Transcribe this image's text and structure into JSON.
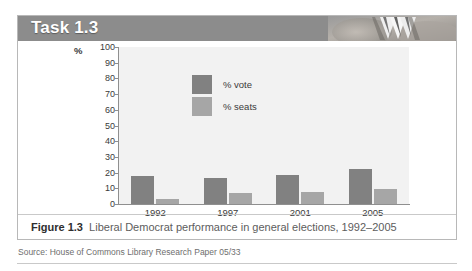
{
  "header": {
    "task_title": "Task 1.3",
    "band_color": "#8c8c8c",
    "decor_icon": "hands-photo-decoration"
  },
  "figure": {
    "caption_label": "Figure 1.3",
    "caption_text": "Liberal Democrat performance in general elections, 1992–2005",
    "source": "Source: House of Commons Library Research Paper 05/33"
  },
  "chart_data": {
    "type": "bar",
    "title": "",
    "subtitle": "",
    "xlabel": "",
    "ylabel": "%",
    "ylim": [
      0,
      100
    ],
    "yticks": [
      100,
      90,
      80,
      70,
      60,
      50,
      40,
      30,
      20,
      10,
      0
    ],
    "categories": [
      "1992",
      "1997",
      "2001",
      "2005"
    ],
    "series": [
      {
        "name": "% vote",
        "values": [
          17.8,
          16.8,
          18.3,
          22.0
        ],
        "color": "#818181"
      },
      {
        "name": "% seats",
        "values": [
          3.1,
          7.0,
          7.9,
          9.6
        ],
        "color": "#a6a6a6"
      }
    ],
    "legend_position": "inside-top-center",
    "grid": false,
    "plot_background": "#f2f2f2"
  }
}
